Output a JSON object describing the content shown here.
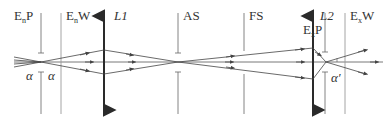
{
  "diagram": {
    "colors": {
      "background": "#ffffff",
      "line": "#555555",
      "lens": "#2a2a2a",
      "window": "#9a9a9a",
      "text": "#333333"
    },
    "axis_y": 62,
    "elements": [
      {
        "id": "EnP",
        "label_main": "E",
        "label_sub": "n",
        "label_tail": "P",
        "x": 41,
        "type": "pupil"
      },
      {
        "id": "EnW",
        "label_main": "E",
        "label_sub": "n",
        "label_tail": "W",
        "x": 61,
        "type": "window"
      },
      {
        "id": "L1",
        "label_main": "L",
        "label_tail": "1",
        "x": 104,
        "type": "lens"
      },
      {
        "id": "AS",
        "label_main": "AS",
        "x": 178,
        "type": "aperture-stop"
      },
      {
        "id": "FS",
        "label_main": "FS",
        "x": 244,
        "type": "field-stop"
      },
      {
        "id": "L2",
        "label_main": "L",
        "label_tail": "2",
        "x": 313,
        "type": "lens"
      },
      {
        "id": "ExP",
        "label_main": "E",
        "label_sub": "x",
        "label_tail": "P",
        "x": 325,
        "type": "pupil"
      },
      {
        "id": "ExW",
        "label_main": "E",
        "label_sub": "x",
        "label_tail": "W",
        "x": 345,
        "type": "window"
      }
    ],
    "angle_labels": [
      {
        "id": "alpha-left",
        "text": "α"
      },
      {
        "id": "alpha-right",
        "text": "α"
      },
      {
        "id": "alpha-prime",
        "text": "α′"
      }
    ]
  }
}
